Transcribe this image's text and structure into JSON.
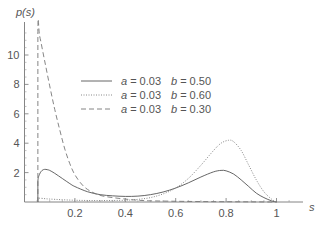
{
  "chart_data": {
    "type": "line",
    "title": "",
    "xlabel": "s",
    "ylabel": "p(s)",
    "xlim": [
      0,
      1.1
    ],
    "ylim": [
      0,
      12
    ],
    "grid": false,
    "legend_position": "upper-center",
    "x_ticks": [
      {
        "value": 0.2,
        "label": "0.2"
      },
      {
        "value": 0.4,
        "label": "0.4"
      },
      {
        "value": 0.6,
        "label": "0.6"
      },
      {
        "value": 0.8,
        "label": "0.8"
      },
      {
        "value": 1.0,
        "label": "1"
      }
    ],
    "y_ticks": [
      {
        "value": 2,
        "label": "2"
      },
      {
        "value": 4,
        "label": "4"
      },
      {
        "value": 6,
        "label": "6"
      },
      {
        "value": 8,
        "label": "8"
      },
      {
        "value": 10,
        "label": "10"
      }
    ],
    "series": [
      {
        "name": "a = 0.03   b = 0.50",
        "a": "0.03",
        "b": "0.50",
        "style": "solid",
        "color": "#555555",
        "x": [
          0.053,
          0.053,
          0.06,
          0.07,
          0.08,
          0.09,
          0.1,
          0.12,
          0.15,
          0.18,
          0.2,
          0.25,
          0.3,
          0.35,
          0.4,
          0.45,
          0.5,
          0.55,
          0.6,
          0.65,
          0.7,
          0.75,
          0.78,
          0.8,
          0.83,
          0.86,
          0.89,
          0.92,
          0.95,
          0.98,
          1.0
        ],
        "y": [
          0.0,
          1.4,
          1.9,
          2.15,
          2.22,
          2.2,
          2.15,
          1.95,
          1.6,
          1.25,
          1.05,
          0.7,
          0.5,
          0.42,
          0.38,
          0.4,
          0.5,
          0.68,
          0.95,
          1.3,
          1.7,
          2.05,
          2.15,
          2.12,
          1.9,
          1.5,
          1.05,
          0.6,
          0.3,
          0.08,
          0.0
        ]
      },
      {
        "name": "a = 0.03   b = 0.60",
        "a": "0.03",
        "b": "0.60",
        "style": "dotted",
        "color": "#888888",
        "x": [
          0.053,
          0.053,
          0.1,
          0.2,
          0.3,
          0.4,
          0.45,
          0.5,
          0.55,
          0.6,
          0.65,
          0.7,
          0.75,
          0.78,
          0.81,
          0.83,
          0.86,
          0.89,
          0.92,
          0.95,
          0.98,
          1.0
        ],
        "y": [
          0.0,
          0.25,
          0.2,
          0.12,
          0.1,
          0.12,
          0.18,
          0.3,
          0.55,
          0.95,
          1.6,
          2.5,
          3.5,
          4.0,
          4.2,
          4.1,
          3.5,
          2.5,
          1.5,
          0.7,
          0.2,
          0.0
        ]
      },
      {
        "name": "a = 0.03   b = 0.30",
        "a": "0.03",
        "b": "0.30",
        "style": "dashed",
        "color": "#777777",
        "x": [
          0.053,
          0.053,
          0.06,
          0.08,
          0.1,
          0.12,
          0.14,
          0.16,
          0.18,
          0.2,
          0.23,
          0.26,
          0.3,
          0.35,
          0.4,
          0.45,
          0.5,
          0.6,
          0.7,
          0.8,
          0.9,
          1.0
        ],
        "y": [
          0.0,
          11.6,
          11.3,
          9.6,
          7.9,
          6.3,
          4.9,
          3.6,
          2.6,
          1.85,
          1.15,
          0.75,
          0.45,
          0.3,
          0.2,
          0.12,
          0.08,
          0.05,
          0.03,
          0.02,
          0.01,
          0.0
        ]
      }
    ]
  },
  "legend": {
    "items": [
      {
        "a_label": "a",
        "a_value": "= 0.03",
        "b_label": "b",
        "b_value": "= 0.50",
        "style": "solid"
      },
      {
        "a_label": "a",
        "a_value": "= 0.03",
        "b_label": "b",
        "b_value": "= 0.60",
        "style": "dotted"
      },
      {
        "a_label": "a",
        "a_value": "= 0.03",
        "b_label": "b",
        "b_value": "= 0.30",
        "style": "dashed"
      }
    ]
  }
}
